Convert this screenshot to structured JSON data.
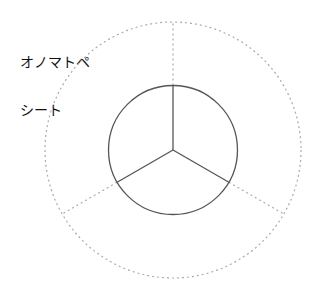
{
  "title": {
    "line1": "オノマトペ",
    "line2": "シート"
  },
  "diagram": {
    "type": "radial-sheet",
    "segments": 3,
    "inner_circle": {
      "style": "solid",
      "color": "#555555"
    },
    "outer_circle": {
      "style": "dotted",
      "color": "#aaaaaa"
    },
    "spokes": {
      "count": 3,
      "inner_style": "solid",
      "outer_style": "dotted"
    }
  }
}
